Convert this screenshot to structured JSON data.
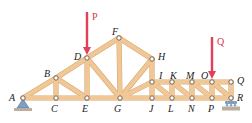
{
  "diagram": {
    "type": "planar-truss",
    "colors": {
      "member": "#f0c898",
      "member_edge": "#d9a56c",
      "load_arrow": "#e0405a",
      "support_fill": "#7f9fc4",
      "ground": "#b9aea0",
      "node_fill": "#ffffff",
      "node_stroke": "#6b5640",
      "label": "#222222"
    },
    "nodes": [
      {
        "id": "A",
        "x": 23,
        "y": 98,
        "lx": 9,
        "ly": 101
      },
      {
        "id": "B",
        "x": 56,
        "y": 78,
        "lx": 44,
        "ly": 77
      },
      {
        "id": "C",
        "x": 56,
        "y": 98,
        "lx": 51,
        "ly": 112
      },
      {
        "id": "D",
        "x": 87,
        "y": 58,
        "lx": 74,
        "ly": 60
      },
      {
        "id": "E",
        "x": 87,
        "y": 98,
        "lx": 82,
        "ly": 112
      },
      {
        "id": "F",
        "x": 119,
        "y": 38,
        "lx": 112,
        "ly": 35
      },
      {
        "id": "G",
        "x": 120,
        "y": 98,
        "lx": 114,
        "ly": 112
      },
      {
        "id": "H",
        "x": 152,
        "y": 59,
        "lx": 158,
        "ly": 60
      },
      {
        "id": "I",
        "x": 152,
        "y": 82,
        "lx": 159,
        "ly": 79
      },
      {
        "id": "J",
        "x": 152,
        "y": 98,
        "lx": 149,
        "ly": 112
      },
      {
        "id": "K",
        "x": 172,
        "y": 82,
        "lx": 170,
        "ly": 79
      },
      {
        "id": "L",
        "x": 172,
        "y": 98,
        "lx": 168,
        "ly": 112
      },
      {
        "id": "M",
        "x": 192,
        "y": 82,
        "lx": 186,
        "ly": 79
      },
      {
        "id": "N",
        "x": 192,
        "y": 98,
        "lx": 188,
        "ly": 112
      },
      {
        "id": "O",
        "x": 212,
        "y": 82,
        "lx": 201,
        "ly": 79
      },
      {
        "id": "P",
        "x": 212,
        "y": 98,
        "lx": 208,
        "ly": 112
      },
      {
        "id": "Q",
        "x": 231,
        "y": 82,
        "lx": 237,
        "ly": 84
      },
      {
        "id": "R",
        "x": 231,
        "y": 98,
        "lx": 237,
        "ly": 101
      }
    ],
    "members": [
      [
        "A",
        "C"
      ],
      [
        "C",
        "E"
      ],
      [
        "E",
        "G"
      ],
      [
        "G",
        "J"
      ],
      [
        "J",
        "L"
      ],
      [
        "L",
        "N"
      ],
      [
        "N",
        "P"
      ],
      [
        "P",
        "R"
      ],
      [
        "A",
        "B"
      ],
      [
        "B",
        "D"
      ],
      [
        "D",
        "F"
      ],
      [
        "F",
        "H"
      ],
      [
        "B",
        "C"
      ],
      [
        "B",
        "E"
      ],
      [
        "D",
        "E"
      ],
      [
        "D",
        "G"
      ],
      [
        "F",
        "G"
      ],
      [
        "G",
        "H"
      ],
      [
        "G",
        "I"
      ],
      [
        "H",
        "I"
      ],
      [
        "I",
        "J"
      ],
      [
        "I",
        "K"
      ],
      [
        "K",
        "M"
      ],
      [
        "M",
        "O"
      ],
      [
        "O",
        "Q"
      ],
      [
        "K",
        "L"
      ],
      [
        "M",
        "N"
      ],
      [
        "O",
        "P"
      ],
      [
        "Q",
        "R"
      ],
      [
        "I",
        "L"
      ],
      [
        "K",
        "N"
      ],
      [
        "M",
        "P"
      ],
      [
        "O",
        "R"
      ]
    ],
    "loads": [
      {
        "label": "P",
        "x": 87,
        "y_start": 12,
        "y_end": 55,
        "lx": 92,
        "ly": 20
      },
      {
        "label": "Q",
        "x": 212,
        "y_start": 37,
        "y_end": 79,
        "lx": 217,
        "ly": 45
      }
    ],
    "supports": [
      {
        "node": "A",
        "type": "pin"
      },
      {
        "node": "R",
        "type": "roller"
      }
    ]
  }
}
